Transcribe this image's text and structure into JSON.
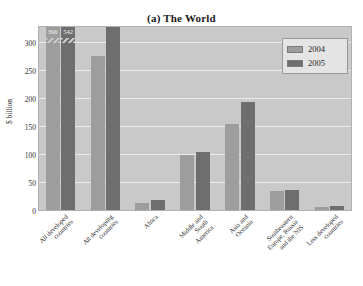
{
  "chart_data": {
    "type": "bar",
    "title": "(a) The World",
    "xlabel": "",
    "ylabel": "$ billion",
    "ylim": [
      0,
      330
    ],
    "yticks": [
      0,
      50,
      100,
      150,
      200,
      250,
      300
    ],
    "grid": true,
    "legend_position": "top-right",
    "categories": [
      "All developed\ncountries",
      "All developing\ncountries",
      "Africa",
      "Middle and\nSouth\nAmerica",
      "Asia and\nOceania",
      "Southeastern\nEurope, Russia\nand the NIS",
      "Less developed\ncountries"
    ],
    "series": [
      {
        "name": "2004",
        "color": "#9d9d9d",
        "values": [
          396,
          276,
          15,
          100,
          155,
          36,
          8
        ]
      },
      {
        "name": "2005",
        "color": "#6e6e6e",
        "values": [
          542,
          330,
          20,
          105,
          195,
          38,
          9
        ]
      }
    ],
    "value_labels": [
      {
        "series": "2004",
        "category_index": 0,
        "text": "396",
        "truncated": true
      },
      {
        "series": "2005",
        "category_index": 0,
        "text": "542",
        "truncated": true
      }
    ]
  },
  "legend": {
    "entries": [
      {
        "label": "2004"
      },
      {
        "label": "2005"
      }
    ]
  },
  "colors": {
    "plot_background": "#c9c9c9",
    "gridline": "#eceaea",
    "series_2004": "#9d9d9d",
    "series_2005": "#6e6e6e",
    "text": "#2e2e2e",
    "page_background": "#ffffff"
  }
}
